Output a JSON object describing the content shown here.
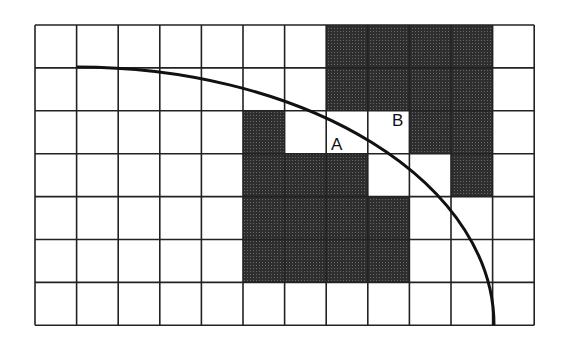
{
  "diagram": {
    "grid": {
      "cols": 12,
      "rows": 7,
      "origin_x": 35,
      "origin_y": 25,
      "cell_w": 41.6,
      "cell_h": 42.9,
      "line_color": "#222222",
      "shade_color": "#3a3a3a",
      "shaded_cells": [
        [
          0,
          7
        ],
        [
          0,
          8
        ],
        [
          0,
          9
        ],
        [
          0,
          10
        ],
        [
          1,
          7
        ],
        [
          1,
          8
        ],
        [
          1,
          9
        ],
        [
          1,
          10
        ],
        [
          2,
          5
        ],
        [
          2,
          9
        ],
        [
          2,
          10
        ],
        [
          3,
          5
        ],
        [
          3,
          6
        ],
        [
          3,
          7
        ],
        [
          3,
          10
        ],
        [
          4,
          5
        ],
        [
          4,
          6
        ],
        [
          4,
          7
        ],
        [
          4,
          8
        ],
        [
          5,
          5
        ],
        [
          5,
          6
        ],
        [
          5,
          7
        ],
        [
          5,
          8
        ]
      ]
    },
    "curve": {
      "description": "quarter-ellipse arc",
      "center_x": 77,
      "center_y": 325,
      "rx": 417,
      "ry": 258,
      "color": "#111111",
      "width": 3
    },
    "labels": [
      {
        "text": "A",
        "x": 331,
        "y": 150
      },
      {
        "text": "B",
        "x": 392,
        "y": 126
      }
    ]
  }
}
